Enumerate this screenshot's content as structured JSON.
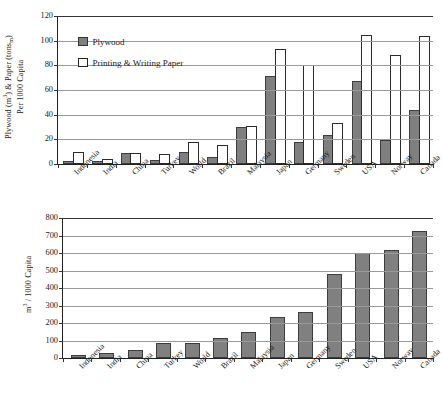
{
  "chart_data": [
    {
      "id": "plywood-paper-per-capita",
      "type": "bar",
      "title": "",
      "xlabel": "",
      "ylabel": "Plywood (m3) & Paper (tonsm) Per 1000 Capita",
      "ylabel_main": "Plywood (m",
      "ylabel_sup1": "3",
      "ylabel_mid": ") & Paper (tons",
      "ylabel_sub1": "m",
      "ylabel_end": ")",
      "ylabel_line2": "Per 1000 Capita",
      "ylim": [
        0,
        120
      ],
      "ytick_step": 20,
      "yticks": [
        0,
        20,
        40,
        60,
        80,
        100,
        120
      ],
      "ytick_labels": [
        "0",
        "20",
        "40",
        "60",
        "80",
        "100",
        "120"
      ],
      "grid": true,
      "legend_position": "upper-left",
      "categories": [
        "Indonesia",
        "India",
        "China",
        "Turkey",
        "World",
        "Brazil",
        "Malaysia",
        "Japan",
        "Germany",
        "Sweden",
        "USA",
        "Norway",
        "Canada"
      ],
      "series": [
        {
          "name": "Plywood",
          "color": "#7f7f7f",
          "style": "filled",
          "values": [
            0.4,
            1.0,
            7.5,
            1.3,
            8.5,
            3.8,
            28.0,
            69.5,
            16.0,
            22.0,
            65.5,
            17.5,
            42.5
          ]
        },
        {
          "name": "Printing & Writing Paper",
          "color": "#ffffff",
          "style": "outlined",
          "values": [
            8.5,
            2.2,
            7.0,
            6.2,
            16.5,
            13.5,
            29.5,
            91.5,
            78.5,
            31.5,
            103.0,
            87.0,
            102.0
          ]
        }
      ]
    },
    {
      "id": "roundwood-per-capita",
      "type": "bar",
      "title": "",
      "xlabel": "",
      "ylabel": "m3 / 1000 Capita",
      "ylabel_main": "m",
      "ylabel_sup1": "3",
      "ylabel_end": " / 1000 Capita",
      "ylim": [
        0,
        800
      ],
      "ytick_step": 100,
      "yticks": [
        0,
        100,
        200,
        300,
        400,
        500,
        600,
        700,
        800
      ],
      "ytick_labels": [
        "0",
        "100",
        "200",
        "300",
        "400",
        "500",
        "600",
        "700",
        "800"
      ],
      "grid": true,
      "legend_position": "none",
      "categories": [
        "Indonesia",
        "India",
        "China",
        "Turkey",
        "World",
        "Brazil",
        "Malaysia",
        "Japan",
        "Germany",
        "Sweden",
        "USA",
        "Norway",
        "Canada"
      ],
      "series": [
        {
          "name": "",
          "color": "#808080",
          "style": "filled",
          "values": [
            8,
            18,
            33,
            75,
            76,
            105,
            140,
            225,
            253,
            470,
            590,
            605,
            715
          ]
        }
      ]
    }
  ]
}
